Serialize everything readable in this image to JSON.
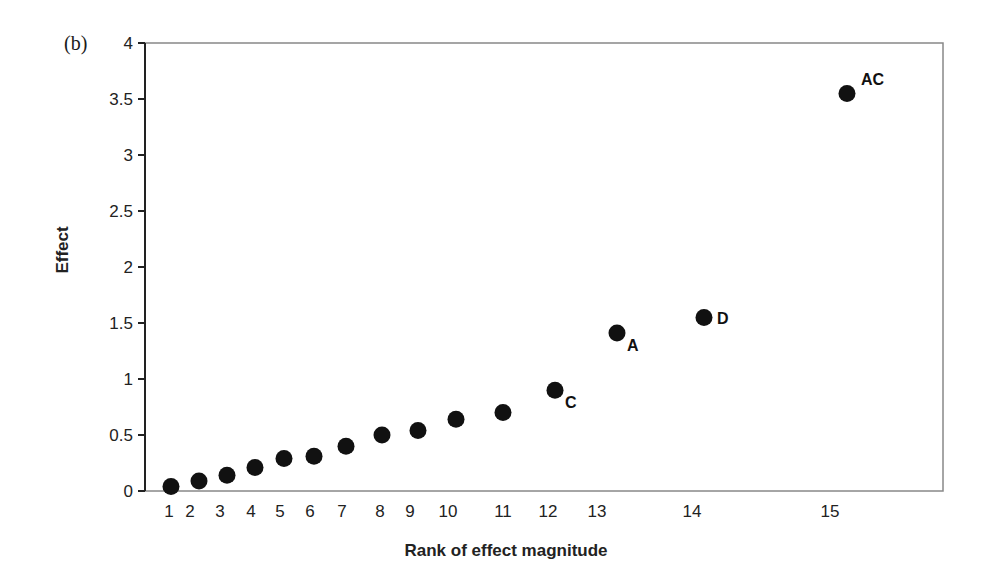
{
  "panel_label": "(b)",
  "chart_data": {
    "type": "scatter",
    "title": "",
    "xlabel": "Rank of effect magnitude",
    "ylabel": "Effect",
    "ylim": [
      0,
      4
    ],
    "grid": false,
    "legend": null,
    "y_ticks": [
      0,
      0.5,
      1,
      1.5,
      2,
      2.5,
      3,
      3.5,
      4
    ],
    "y_tick_labels": [
      "0",
      "0.5",
      "1",
      "1.5",
      "2",
      "2.5",
      "3",
      "3.5",
      "4"
    ],
    "x_tick_labels": [
      "1",
      "2",
      "3",
      "4",
      "5",
      "6",
      "7",
      "8",
      "9",
      "10",
      "11",
      "12",
      "13",
      "14",
      "15"
    ],
    "points": [
      {
        "rank": 1,
        "effect": 0.04,
        "label": ""
      },
      {
        "rank": 2,
        "effect": 0.09,
        "label": ""
      },
      {
        "rank": 3,
        "effect": 0.14,
        "label": ""
      },
      {
        "rank": 4,
        "effect": 0.21,
        "label": ""
      },
      {
        "rank": 5,
        "effect": 0.29,
        "label": ""
      },
      {
        "rank": 6,
        "effect": 0.31,
        "label": ""
      },
      {
        "rank": 7,
        "effect": 0.4,
        "label": ""
      },
      {
        "rank": 8,
        "effect": 0.5,
        "label": ""
      },
      {
        "rank": 9,
        "effect": 0.54,
        "label": ""
      },
      {
        "rank": 10,
        "effect": 0.64,
        "label": ""
      },
      {
        "rank": 11,
        "effect": 0.7,
        "label": ""
      },
      {
        "rank": 12,
        "effect": 0.9,
        "label": "C"
      },
      {
        "rank": 13,
        "effect": 1.41,
        "label": "A"
      },
      {
        "rank": 14,
        "effect": 1.55,
        "label": "D"
      },
      {
        "rank": 15,
        "effect": 3.55,
        "label": "AC"
      }
    ],
    "point_color": "#111111",
    "axis_color": "#222222",
    "frame_color": "#888888"
  },
  "layout": {
    "x_tick_px": [
      169,
      190,
      220,
      251,
      280,
      310,
      342,
      380,
      410,
      448,
      503,
      548,
      597,
      692,
      830
    ],
    "point_x_px": [
      171,
      199,
      227,
      255,
      284,
      314,
      346,
      382,
      418,
      456,
      503,
      555,
      617,
      704,
      847
    ],
    "label_offsets": {
      "C": [
        10,
        18
      ],
      "A": [
        10,
        18
      ],
      "D": [
        13,
        7
      ],
      "AC": [
        14,
        -8
      ]
    }
  }
}
